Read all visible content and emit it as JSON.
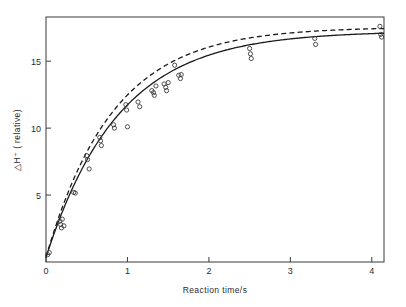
{
  "chart_data": {
    "type": "scatter",
    "title": "",
    "xlabel": "Reaction time/s",
    "ylabel": "△H⁺ ( relative)",
    "xlim": [
      0,
      4.15
    ],
    "ylim": [
      0,
      18.3
    ],
    "grid": false,
    "legend": "none",
    "xticks": [
      0,
      1,
      2,
      3,
      4
    ],
    "xtick_labels": [
      "0",
      "1",
      "2",
      "3",
      "4"
    ],
    "yticks": [
      5,
      10,
      15
    ],
    "ytick_labels": [
      "5",
      "10",
      "15"
    ],
    "marker": "open-circle",
    "frame": "box",
    "points": [
      {
        "x": 0.02,
        "y": 0.55
      },
      {
        "x": 0.04,
        "y": 0.7
      },
      {
        "x": 0.17,
        "y": 3.05
      },
      {
        "x": 0.18,
        "y": 2.8
      },
      {
        "x": 0.19,
        "y": 2.55
      },
      {
        "x": 0.2,
        "y": 3.2
      },
      {
        "x": 0.22,
        "y": 2.7
      },
      {
        "x": 0.34,
        "y": 5.2
      },
      {
        "x": 0.36,
        "y": 5.15
      },
      {
        "x": 0.5,
        "y": 7.95
      },
      {
        "x": 0.51,
        "y": 7.65
      },
      {
        "x": 0.53,
        "y": 6.95
      },
      {
        "x": 0.66,
        "y": 9.3
      },
      {
        "x": 0.67,
        "y": 9.05
      },
      {
        "x": 0.68,
        "y": 8.7
      },
      {
        "x": 0.83,
        "y": 10.25
      },
      {
        "x": 0.84,
        "y": 10.0
      },
      {
        "x": 0.98,
        "y": 11.75
      },
      {
        "x": 0.99,
        "y": 11.35
      },
      {
        "x": 1.0,
        "y": 10.1
      },
      {
        "x": 1.13,
        "y": 11.95
      },
      {
        "x": 1.15,
        "y": 11.6
      },
      {
        "x": 1.3,
        "y": 12.8
      },
      {
        "x": 1.32,
        "y": 12.65
      },
      {
        "x": 1.33,
        "y": 12.45
      },
      {
        "x": 1.35,
        "y": 13.15
      },
      {
        "x": 1.45,
        "y": 13.3
      },
      {
        "x": 1.47,
        "y": 13.05
      },
      {
        "x": 1.48,
        "y": 12.8
      },
      {
        "x": 1.5,
        "y": 13.4
      },
      {
        "x": 1.58,
        "y": 14.7
      },
      {
        "x": 1.63,
        "y": 13.95
      },
      {
        "x": 1.65,
        "y": 13.7
      },
      {
        "x": 1.66,
        "y": 14.0
      },
      {
        "x": 2.5,
        "y": 15.95
      },
      {
        "x": 2.51,
        "y": 15.55
      },
      {
        "x": 2.52,
        "y": 15.2
      },
      {
        "x": 3.3,
        "y": 16.7
      },
      {
        "x": 3.31,
        "y": 16.25
      },
      {
        "x": 4.1,
        "y": 17.6
      },
      {
        "x": 4.11,
        "y": 17.0
      },
      {
        "x": 4.12,
        "y": 16.8
      }
    ],
    "series": [
      {
        "name": "fit-solid",
        "style": "solid",
        "model": "rise-to-max",
        "asymptote": 17.25,
        "rate": 1.12,
        "y0": 0.35
      },
      {
        "name": "fit-dashed",
        "style": "dashed",
        "model": "rise-to-max",
        "asymptote": 17.55,
        "rate": 1.22,
        "y0": 0.35
      }
    ]
  },
  "colors": {
    "background": "#ffffff",
    "axis": "#3a3a3a",
    "curve_solid": "#1b1b1b",
    "curve_dashed": "#1b1b1b",
    "marker_stroke": "#3c3c3c",
    "text": "#2b2b2b"
  }
}
